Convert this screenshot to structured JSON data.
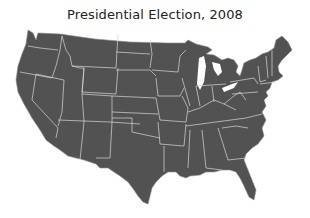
{
  "title": "Presidential Election, 2008",
  "map": {
    "region": "Contiguous United States",
    "fill_color": "#525252",
    "border_color": "#d8d8d8",
    "background_color": "#ffffff"
  }
}
